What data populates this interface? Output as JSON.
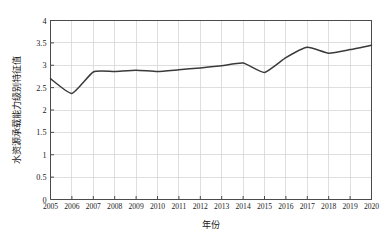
{
  "chart_data": {
    "type": "line",
    "title": "",
    "xlabel": "年份",
    "ylabel": "水资源承载能力级别特征值",
    "xlim": [
      2005,
      2020
    ],
    "ylim": [
      0,
      4
    ],
    "grid": true,
    "legend": "none",
    "line_color": "#3a3a3a",
    "x": [
      2005,
      2006,
      2007,
      2008,
      2009,
      2010,
      2011,
      2012,
      2013,
      2014,
      2015,
      2016,
      2017,
      2018,
      2019,
      2020
    ],
    "categories": [
      "2005",
      "2006",
      "2007",
      "2008",
      "2009",
      "2010",
      "2011",
      "2012",
      "2013",
      "2014",
      "2015",
      "2016",
      "2017",
      "2018",
      "2019",
      "2020"
    ],
    "values": [
      2.7,
      2.37,
      2.85,
      2.86,
      2.89,
      2.86,
      2.9,
      2.94,
      2.99,
      3.05,
      2.84,
      3.17,
      3.4,
      3.27,
      3.35,
      3.45
    ],
    "ytick_labels": [
      "0",
      "0.5",
      "1",
      "1.5",
      "2",
      "2.5",
      "3",
      "3.5",
      "4"
    ],
    "ytick_values": [
      0,
      0.5,
      1,
      1.5,
      2,
      2.5,
      3,
      3.5,
      4
    ],
    "xtick_labels": [
      "2005",
      "2006",
      "2007",
      "2008",
      "2009",
      "2010",
      "2011",
      "2012",
      "2013",
      "2014",
      "2015",
      "2016",
      "2017",
      "2018",
      "2019",
      "2020"
    ]
  },
  "axes": {
    "x_title": "年份",
    "y_title": "水资源承载能力级别特征值"
  }
}
